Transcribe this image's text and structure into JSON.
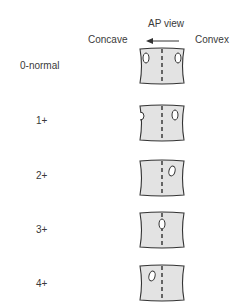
{
  "header": {
    "title": "AP view",
    "left_label": "Concave",
    "right_label": "Convex",
    "arrow_direction": "left"
  },
  "grades": [
    {
      "label": "0-normal",
      "pedicle_position": "both pedicles symmetric at edges"
    },
    {
      "label": "1+",
      "pedicle_position": "concave pedicle disappearing, convex pedicle shifted slightly toward midline"
    },
    {
      "label": "2+",
      "pedicle_position": "concave pedicle gone, convex pedicle shifted further toward midline"
    },
    {
      "label": "3+",
      "pedicle_position": "convex pedicle at midline"
    },
    {
      "label": "4+",
      "pedicle_position": "convex pedicle past midline toward concave side"
    }
  ],
  "colors": {
    "vertebra_fill": "#e3e3e3",
    "outline": "#333333",
    "text": "#3a3a3a"
  }
}
